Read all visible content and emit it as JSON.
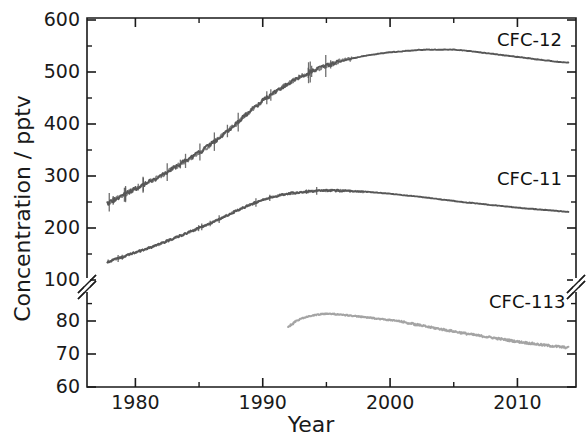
{
  "chart_data": {
    "type": "line",
    "title": "",
    "xlabel": "Year",
    "ylabel": "Concentration / pptv",
    "xlim": [
      1976.2,
      2014.6
    ],
    "xticks": [
      1980,
      1990,
      2000,
      2010
    ],
    "xticklabels": [
      "1980",
      "1990",
      "2000",
      "2010"
    ],
    "xminorticks": [
      1985,
      1995,
      2005
    ],
    "yticklabels": [
      "600",
      "500",
      "400",
      "300",
      "200",
      "100",
      "80",
      "70",
      "60"
    ],
    "y_axis_note": "broken axis: upper segment linear 100-600 pptv, lower segment log-like 60-100 pptv",
    "yticks_upper": [
      600,
      500,
      400,
      300,
      200,
      100
    ],
    "yticks_lower": [
      80,
      70,
      60
    ],
    "ylim_upper": [
      100,
      600
    ],
    "ylim_lower": [
      60,
      100
    ],
    "grid": false,
    "legend_position": "inline-right",
    "axis_break": true,
    "colors": {
      "cfc12": "#575757",
      "cfc11": "#575757",
      "cfc113": "#9a9a9a",
      "axis": "#1a1a1a",
      "background": "#ffffff"
    },
    "series": [
      {
        "name": "CFC-12",
        "label": "CFC-12",
        "color": "#575757",
        "noisy": true,
        "x": [
          1977.8,
          1979,
          1980,
          1981,
          1982,
          1983,
          1984,
          1985,
          1986,
          1987,
          1988,
          1989,
          1990,
          1991,
          1992,
          1993,
          1994,
          1995,
          1996,
          1997,
          1998,
          1999,
          2000,
          2001,
          2002,
          2003,
          2004,
          2005,
          2006,
          2007,
          2008,
          2009,
          2010,
          2011,
          2012,
          2013,
          2014
        ],
        "values": [
          248,
          262,
          276,
          288,
          300,
          315,
          330,
          345,
          362,
          382,
          402,
          425,
          445,
          462,
          478,
          492,
          503,
          512,
          520,
          526,
          531,
          535,
          538,
          540,
          542,
          543,
          543,
          543,
          541,
          538,
          535,
          532,
          529,
          526,
          523,
          520,
          518
        ]
      },
      {
        "name": "CFC-11",
        "label": "CFC-11",
        "color": "#575757",
        "noisy": true,
        "x": [
          1977.8,
          1979,
          1980,
          1981,
          1982,
          1983,
          1984,
          1985,
          1986,
          1987,
          1988,
          1989,
          1990,
          1991,
          1992,
          1993,
          1994,
          1995,
          1996,
          1997,
          1998,
          1999,
          2000,
          2001,
          2002,
          2003,
          2004,
          2005,
          2006,
          2007,
          2008,
          2009,
          2010,
          2011,
          2012,
          2013,
          2014
        ],
        "values": [
          135,
          144,
          153,
          161,
          170,
          180,
          190,
          200,
          210,
          222,
          234,
          245,
          254,
          261,
          266,
          269,
          271,
          272,
          272,
          271,
          270,
          268,
          266,
          263,
          261,
          258,
          255,
          252,
          249,
          247,
          244,
          242,
          239,
          237,
          235,
          233,
          231
        ]
      },
      {
        "name": "CFC-113",
        "label": "CFC-113",
        "color": "#9a9a9a",
        "noisy": true,
        "x": [
          1992.0,
          1992.5,
          1993,
          1993.5,
          1994,
          1994.5,
          1995,
          1995.5,
          1996,
          1997,
          1998,
          1999,
          2000,
          2001,
          2002,
          2003,
          2004,
          2005,
          2006,
          2007,
          2008,
          2009,
          2010,
          2011,
          2012,
          2013,
          2014
        ],
        "values": [
          78.0,
          79.6,
          81.2,
          82.3,
          83.2,
          83.7,
          84.0,
          83.9,
          83.6,
          82.9,
          82.1,
          81.3,
          80.5,
          79.7,
          78.9,
          78.1,
          77.4,
          76.7,
          76.0,
          75.4,
          74.8,
          74.2,
          73.6,
          73.1,
          72.6,
          72.2,
          71.8
        ]
      }
    ],
    "series_label_positions": [
      {
        "name": "CFC-12",
        "x": 497,
        "y": 29
      },
      {
        "name": "CFC-11",
        "x": 497,
        "y": 168
      },
      {
        "name": "CFC-113",
        "x": 489,
        "y": 291
      }
    ]
  }
}
